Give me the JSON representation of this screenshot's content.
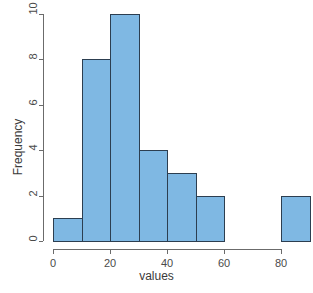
{
  "chart_data": {
    "type": "bar",
    "subtype": "histogram",
    "title": "",
    "xlabel": "values",
    "ylabel": "Frequency",
    "xlim": [
      0,
      90
    ],
    "ylim": [
      0,
      10
    ],
    "grid": false,
    "legend": false,
    "bin_width": 10,
    "bin_edges": [
      0,
      10,
      20,
      30,
      40,
      50,
      60,
      70,
      80,
      90
    ],
    "categories": [
      "0-10",
      "10-20",
      "20-30",
      "30-40",
      "40-50",
      "50-60",
      "60-70",
      "70-80",
      "80-90"
    ],
    "values": [
      1,
      8,
      10,
      4,
      3,
      2,
      0,
      0,
      2
    ],
    "bin_starts": [
      0,
      10,
      20,
      30,
      40,
      50,
      60,
      70,
      80
    ],
    "x_ticks": [
      0,
      20,
      40,
      60,
      80
    ],
    "x_tick_labels": [
      "0",
      "20",
      "40",
      "60",
      "80"
    ],
    "y_ticks": [
      0,
      2,
      4,
      6,
      8,
      10
    ],
    "y_tick_labels": [
      "0",
      "2",
      "4",
      "6",
      "8",
      "10"
    ],
    "bar_fill_color": "#7fb8e3",
    "bar_border_color": "#2c3e50",
    "axis_color": "#6b6b6b",
    "background_color": "#ffffff"
  }
}
